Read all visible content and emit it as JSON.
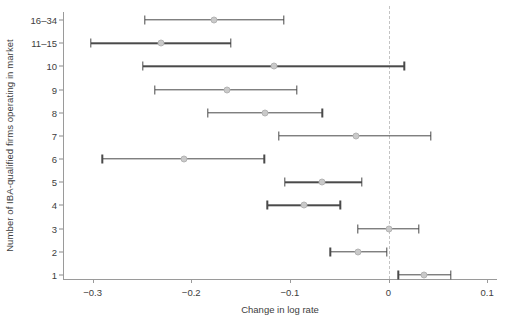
{
  "chart_data": {
    "type": "scatter",
    "title": "",
    "subtitle": "",
    "xlabel": "Change in log rate",
    "ylabel": "Number of IBA-qualified firms operating in market",
    "xlim": [
      -0.33,
      0.11
    ],
    "ylim": [
      0,
      13
    ],
    "grid": false,
    "legend": null,
    "orientation": "horizontal",
    "xticks": [
      -0.3,
      -0.2,
      -0.1,
      0.0,
      0.1
    ],
    "xticklabels": [
      "−0.3",
      "−0.2",
      "−0.1",
      "0",
      "0.1"
    ],
    "categories": [
      "16–34",
      "11–15",
      "10",
      "9",
      "8",
      "7",
      "6",
      "5",
      "4",
      "3",
      "2",
      "1"
    ],
    "reference_line": {
      "orientation": "vertical",
      "value": 0.0,
      "style": "dashed",
      "color": "#c4c4c4"
    },
    "points": [
      {
        "category": "16–34",
        "estimate": -0.177,
        "ci_low": -0.247,
        "ci_high": -0.106
      },
      {
        "category": "11–15",
        "estimate": -0.231,
        "ci_low": -0.302,
        "ci_high": -0.16
      },
      {
        "category": "10",
        "estimate": -0.116,
        "ci_low": -0.249,
        "ci_high": 0.016
      },
      {
        "category": "9",
        "estimate": -0.164,
        "ci_low": -0.237,
        "ci_high": -0.093
      },
      {
        "category": "8",
        "estimate": -0.125,
        "ci_low": -0.183,
        "ci_high": -0.067
      },
      {
        "category": "7",
        "estimate": -0.033,
        "ci_low": -0.111,
        "ci_high": 0.043
      },
      {
        "category": "6",
        "estimate": -0.207,
        "ci_low": -0.29,
        "ci_high": -0.126
      },
      {
        "category": "5",
        "estimate": -0.067,
        "ci_low": -0.105,
        "ci_high": -0.027
      },
      {
        "category": "4",
        "estimate": -0.086,
        "ci_low": -0.123,
        "ci_high": -0.049
      },
      {
        "category": "3",
        "estimate": 0.0,
        "ci_low": -0.031,
        "ci_high": 0.031
      },
      {
        "category": "2",
        "estimate": -0.031,
        "ci_low": -0.059,
        "ci_high": -0.002
      },
      {
        "category": "1",
        "estimate": 0.036,
        "ci_low": 0.01,
        "ci_high": 0.063
      }
    ],
    "colors": {
      "point_fill": "#c9c9c9",
      "point_edge": "#b4b4b4",
      "interval": "#4a4a4a",
      "axis": "#9a9a9a",
      "text": "#3d3d3d",
      "reference": "#c4c4c4",
      "background": "#ffffff"
    }
  }
}
